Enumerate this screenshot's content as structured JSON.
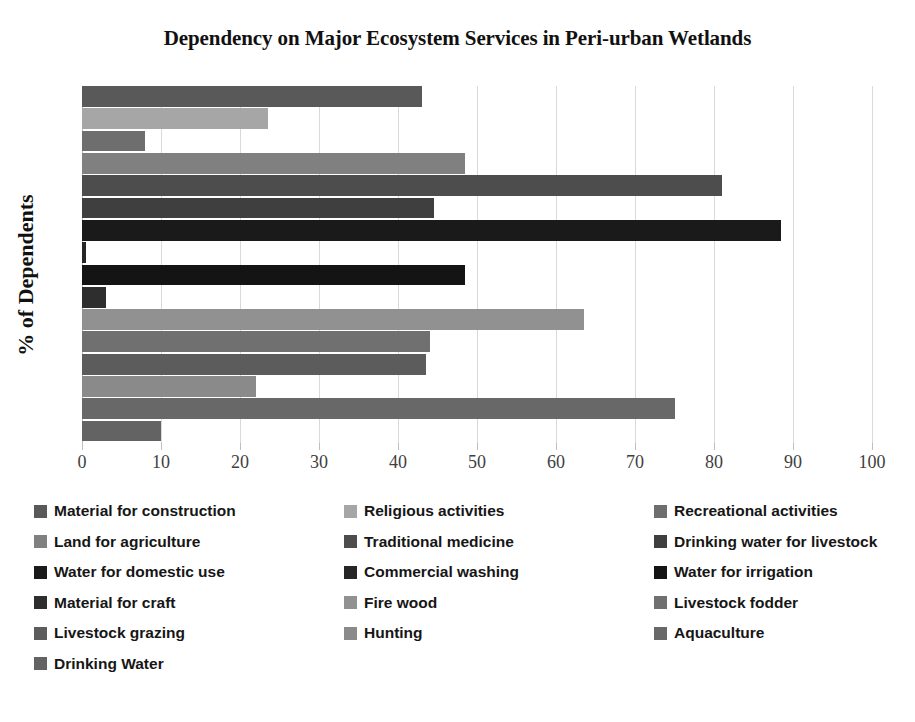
{
  "chart_data": {
    "type": "bar",
    "orientation": "horizontal",
    "title": "Dependency on Major Ecosystem Services in Peri-urban Wetlands",
    "xlabel": "",
    "ylabel": "% of Dependents",
    "xlim": [
      0,
      100
    ],
    "xticks": [
      0,
      10,
      20,
      30,
      40,
      50,
      60,
      70,
      80,
      90,
      100
    ],
    "xtick_labels": [
      "0",
      "10",
      "20",
      "30",
      "40",
      "50",
      "60",
      "70",
      "80",
      "90",
      "100"
    ],
    "grid": true,
    "grid_axis": "x",
    "legend_position": "bottom",
    "legend_columns": 3,
    "categories": [
      "Material for construction",
      "Religious activities",
      "Recreational activities",
      "Land for agriculture",
      "Traditional medicine",
      "Drinking water for livestock",
      "Water for domestic use",
      "Commercial washing",
      "Water for irrigation",
      "Material for craft",
      "Fire wood",
      "Livestock fodder",
      "Livestock grazing",
      "Hunting",
      "Aquaculture",
      "Drinking Water"
    ],
    "values": [
      43,
      23.5,
      8,
      48.5,
      81,
      44.5,
      88.5,
      0.5,
      48.5,
      3,
      63.5,
      44,
      43.5,
      22,
      75,
      10
    ],
    "colors": [
      "#595959",
      "#a6a6a6",
      "#6e6e6e",
      "#808080",
      "#4d4d4d",
      "#3f3f3f",
      "#1a1a1a",
      "#262626",
      "#141414",
      "#2e2e2e",
      "#919191",
      "#707070",
      "#5c5c5c",
      "#8a8a8a",
      "#686868",
      "#636363"
    ],
    "series": [
      {
        "name": "Material for construction",
        "value": 43
      },
      {
        "name": "Religious activities",
        "value": 23.5
      },
      {
        "name": "Recreational activities",
        "value": 8
      },
      {
        "name": "Land for agriculture",
        "value": 48.5
      },
      {
        "name": "Traditional medicine",
        "value": 81
      },
      {
        "name": "Drinking water for livestock",
        "value": 44.5
      },
      {
        "name": "Water for domestic use",
        "value": 88.5
      },
      {
        "name": "Commercial washing",
        "value": 0.5
      },
      {
        "name": "Water for irrigation",
        "value": 48.5
      },
      {
        "name": "Material for craft",
        "value": 3
      },
      {
        "name": "Fire wood",
        "value": 63.5
      },
      {
        "name": "Livestock fodder",
        "value": 44
      },
      {
        "name": "Livestock grazing",
        "value": 43.5
      },
      {
        "name": "Hunting",
        "value": 22
      },
      {
        "name": "Aquaculture",
        "value": 75
      },
      {
        "name": "Drinking Water",
        "value": 10
      }
    ]
  },
  "legend": {
    "items": [
      {
        "label": "Material for construction",
        "color": "#595959"
      },
      {
        "label": "Religious activities",
        "color": "#a6a6a6"
      },
      {
        "label": "Recreational activities",
        "color": "#6e6e6e"
      },
      {
        "label": "Land for agriculture",
        "color": "#808080"
      },
      {
        "label": "Traditional medicine",
        "color": "#4d4d4d"
      },
      {
        "label": "Drinking water for livestock",
        "color": "#3f3f3f"
      },
      {
        "label": "Water for domestic use",
        "color": "#1a1a1a"
      },
      {
        "label": "Commercial washing",
        "color": "#262626"
      },
      {
        "label": "Water for irrigation",
        "color": "#141414"
      },
      {
        "label": "Material for craft",
        "color": "#2e2e2e"
      },
      {
        "label": "Fire wood",
        "color": "#919191"
      },
      {
        "label": "Livestock fodder",
        "color": "#707070"
      },
      {
        "label": "Livestock grazing",
        "color": "#5c5c5c"
      },
      {
        "label": "Hunting",
        "color": "#8a8a8a"
      },
      {
        "label": "Aquaculture",
        "color": "#686868"
      },
      {
        "label": "Drinking Water",
        "color": "#636363"
      }
    ]
  }
}
